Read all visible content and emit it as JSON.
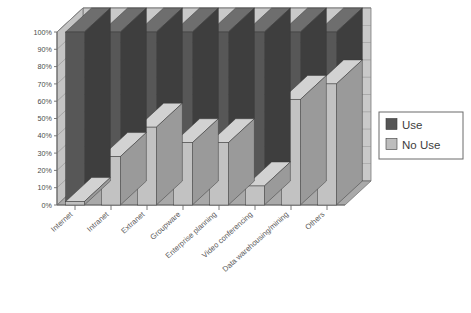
{
  "chart_data": {
    "type": "bar",
    "subtype": "100% stacked column (3D)",
    "title": "",
    "subtitle": "",
    "xlabel": "",
    "ylabel": "",
    "ylim": [
      0,
      100
    ],
    "grid": true,
    "legend_position": "right",
    "categories": [
      "Internet",
      "Intranet",
      "Extranet",
      "Groupware",
      "Enterprise planning",
      "Video conferencing",
      "Data warehousing/mining",
      "Others"
    ],
    "ytick_labels": [
      "0%",
      "10%",
      "20%",
      "30%",
      "40%",
      "50%",
      "60%",
      "70%",
      "80%",
      "90%",
      "100%"
    ],
    "ytick_values": [
      0,
      10,
      20,
      30,
      40,
      50,
      60,
      70,
      80,
      90,
      100
    ],
    "series": [
      {
        "name": "Use",
        "color": "#555555",
        "values": [
          98,
          72,
          55,
          64,
          64,
          89,
          39,
          30
        ]
      },
      {
        "name": "No Use",
        "color": "#bdbdbd",
        "values": [
          2,
          28,
          45,
          36,
          36,
          11,
          61,
          70
        ]
      }
    ]
  },
  "legend": {
    "items": [
      {
        "label": "Use",
        "swatch": "#555555"
      },
      {
        "label": "No Use",
        "swatch": "#bdbdbd"
      }
    ]
  },
  "colors": {
    "use_front": "#575757",
    "use_side": "#3e3e3e",
    "use_top": "#6e6e6e",
    "nouse_front": "#c2c2c2",
    "nouse_side": "#9a9a9a",
    "nouse_top": "#d2d2d2",
    "back_wall": "#c9c9c9",
    "floor": "#a9a9a9",
    "grid_line": "#8a8a8a",
    "axis_line": "#6b6b6b",
    "text": "#4a4a4a",
    "legend_border": "#6b6b6b",
    "background": "#ffffff"
  }
}
